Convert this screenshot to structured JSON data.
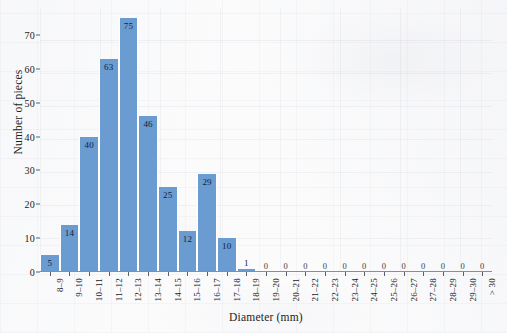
{
  "chart_data": {
    "type": "bar",
    "title": "",
    "subtitle": "",
    "xlabel": "Diameter (mm)",
    "ylabel": "Number of pieces",
    "categories": [
      "8–9",
      "9–10",
      "10–11",
      "11–12",
      "12–13",
      "13–14",
      "14–15",
      "15–16",
      "16–17",
      "17–18",
      "18–19",
      "19–20",
      "20–21",
      "21–22",
      "22–23",
      "23–24",
      "24–25",
      "25–26",
      "26–27",
      "27–28",
      "28–29",
      "29–30",
      "> 30"
    ],
    "values": [
      5,
      14,
      40,
      63,
      75,
      46,
      25,
      12,
      29,
      10,
      1,
      0,
      0,
      0,
      0,
      0,
      0,
      0,
      0,
      0,
      0,
      0,
      0
    ],
    "value_labels": [
      "5",
      "14",
      "40",
      "63",
      "75",
      "46",
      "25",
      "12",
      "29",
      "10",
      "1",
      "0",
      "0",
      "0",
      "0",
      "0",
      "0",
      "0",
      "0",
      "0",
      "0",
      "0",
      "0"
    ],
    "ylim": [
      0,
      78
    ],
    "yticks": [
      0,
      10,
      20,
      30,
      40,
      50,
      60,
      70
    ],
    "ytick_labels": [
      "0",
      "10",
      "20",
      "30",
      "40",
      "50",
      "60",
      "70"
    ],
    "grid": true,
    "legend": "none",
    "bar_color": "#6a9bd1",
    "bar_edge_color": "#ffffff",
    "axis_color": "#6f93c0",
    "label_color": "#10243c",
    "background_color": "#fbfbfc"
  }
}
